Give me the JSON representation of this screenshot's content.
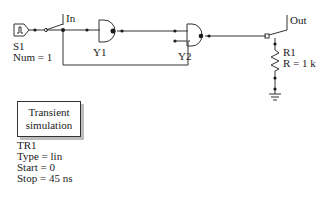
{
  "schematic": {
    "source": {
      "name": "S1",
      "param": "Num = 1",
      "icon": "pulse-source-icon"
    },
    "input_switch": {
      "label": "In"
    },
    "gate_y1": {
      "name": "Y1",
      "type": "NAND"
    },
    "gate_y2": {
      "name": "Y2",
      "type": "NAND"
    },
    "output_switch": {
      "label": "Out"
    },
    "resistor": {
      "name": "R1",
      "param": "R = 1 k"
    },
    "ground": {
      "icon": "ground-icon"
    }
  },
  "simulation": {
    "block_line1": "Transient",
    "block_line2": "simulation",
    "name": "TR1",
    "type": "Type = lin",
    "start": "Start = 0",
    "stop": "Stop = 45 ns"
  },
  "colors": {
    "wire": "#333333",
    "shadow": "#bdbdbd"
  }
}
